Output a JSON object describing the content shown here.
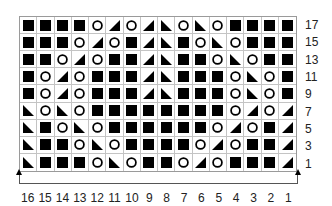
{
  "chart_data": {
    "type": "table",
    "legend": {
      "B": "black-square",
      "O": "circle",
      "R": "triangle-right-lean",
      "L": "triangle-left-lean"
    },
    "rows": [
      {
        "label": "17",
        "cells": [
          "B",
          "B",
          "B",
          "B",
          "O",
          "R",
          "O",
          "R",
          "L",
          "O",
          "L",
          "O",
          "B",
          "B",
          "B",
          "B"
        ]
      },
      {
        "label": "15",
        "cells": [
          "B",
          "B",
          "B",
          "O",
          "R",
          "O",
          "B",
          "R",
          "L",
          "B",
          "O",
          "L",
          "O",
          "B",
          "B",
          "B"
        ]
      },
      {
        "label": "13",
        "cells": [
          "B",
          "B",
          "O",
          "R",
          "O",
          "B",
          "B",
          "R",
          "L",
          "B",
          "B",
          "O",
          "L",
          "O",
          "B",
          "B"
        ]
      },
      {
        "label": "11",
        "cells": [
          "B",
          "O",
          "R",
          "O",
          "B",
          "B",
          "B",
          "R",
          "L",
          "B",
          "B",
          "B",
          "O",
          "L",
          "O",
          "B"
        ]
      },
      {
        "label": "9",
        "cells": [
          "B",
          "O",
          "R",
          "O",
          "B",
          "B",
          "B",
          "R",
          "L",
          "B",
          "B",
          "B",
          "O",
          "L",
          "O",
          "B"
        ]
      },
      {
        "label": "7",
        "cells": [
          "L",
          "O",
          "L",
          "O",
          "B",
          "B",
          "B",
          "B",
          "B",
          "B",
          "B",
          "B",
          "O",
          "R",
          "O",
          "R"
        ]
      },
      {
        "label": "5",
        "cells": [
          "L",
          "B",
          "O",
          "L",
          "O",
          "B",
          "B",
          "B",
          "B",
          "B",
          "B",
          "O",
          "R",
          "O",
          "B",
          "R"
        ]
      },
      {
        "label": "3",
        "cells": [
          "L",
          "B",
          "B",
          "O",
          "L",
          "O",
          "B",
          "B",
          "B",
          "B",
          "O",
          "R",
          "O",
          "B",
          "B",
          "R"
        ]
      },
      {
        "label": "1",
        "cells": [
          "L",
          "B",
          "B",
          "B",
          "O",
          "L",
          "O",
          "B",
          "B",
          "O",
          "R",
          "O",
          "B",
          "B",
          "B",
          "R"
        ]
      }
    ],
    "column_labels": [
      "16",
      "15",
      "14",
      "13",
      "12",
      "11",
      "10",
      "9",
      "8",
      "7",
      "6",
      "5",
      "4",
      "3",
      "2",
      "1"
    ]
  }
}
